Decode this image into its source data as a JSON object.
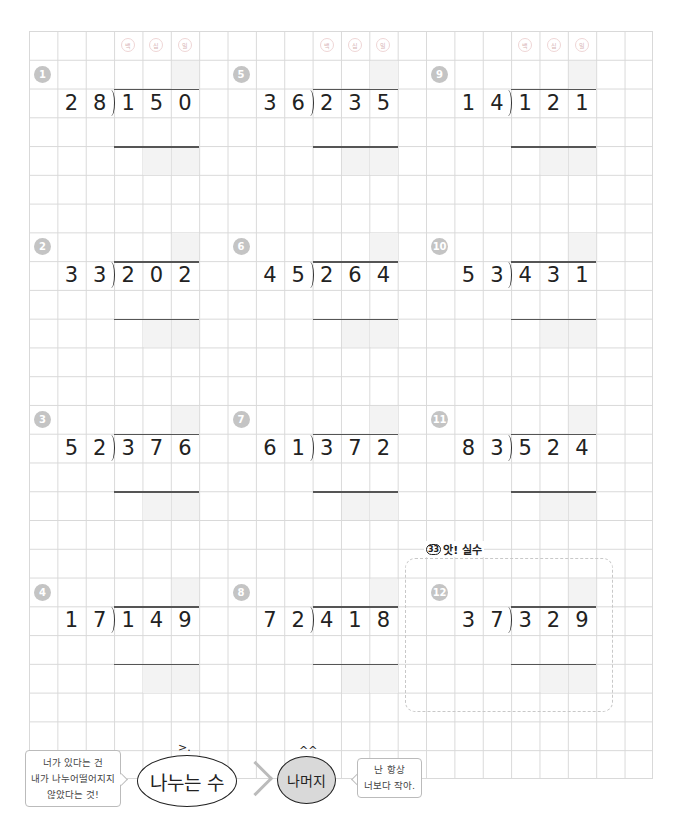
{
  "worksheet": {
    "column_headers": [
      "백",
      "십",
      "일"
    ],
    "mistake_section": {
      "icon": "33",
      "label": "앗! 실수"
    },
    "problems": [
      {
        "num": "1",
        "divisor": [
          "2",
          "8"
        ],
        "dividend": [
          "1",
          "5",
          "0"
        ]
      },
      {
        "num": "2",
        "divisor": [
          "3",
          "3"
        ],
        "dividend": [
          "2",
          "0",
          "2"
        ]
      },
      {
        "num": "3",
        "divisor": [
          "5",
          "2"
        ],
        "dividend": [
          "3",
          "7",
          "6"
        ]
      },
      {
        "num": "4",
        "divisor": [
          "1",
          "7"
        ],
        "dividend": [
          "1",
          "4",
          "9"
        ]
      },
      {
        "num": "5",
        "divisor": [
          "3",
          "6"
        ],
        "dividend": [
          "2",
          "3",
          "5"
        ]
      },
      {
        "num": "6",
        "divisor": [
          "4",
          "5"
        ],
        "dividend": [
          "2",
          "6",
          "4"
        ]
      },
      {
        "num": "7",
        "divisor": [
          "6",
          "1"
        ],
        "dividend": [
          "3",
          "7",
          "2"
        ]
      },
      {
        "num": "8",
        "divisor": [
          "7",
          "2"
        ],
        "dividend": [
          "4",
          "1",
          "8"
        ]
      },
      {
        "num": "9",
        "divisor": [
          "1",
          "4"
        ],
        "dividend": [
          "1",
          "2",
          "1"
        ]
      },
      {
        "num": "10",
        "divisor": [
          "5",
          "3"
        ],
        "dividend": [
          "4",
          "3",
          "1"
        ]
      },
      {
        "num": "11",
        "divisor": [
          "8",
          "3"
        ],
        "dividend": [
          "5",
          "2",
          "4"
        ]
      },
      {
        "num": "12",
        "divisor": [
          "3",
          "7"
        ],
        "dividend": [
          "3",
          "2",
          "9"
        ]
      }
    ]
  },
  "footer": {
    "left_bubble": [
      "너가 있다는 건",
      "내가 나누어떨어지지",
      "않았다는 것!"
    ],
    "divisor_character": "나누는 수",
    "divisor_face": ">.",
    "remainder_character": "나머지",
    "remainder_face": "^^",
    "right_bubble": [
      "난 항상",
      "너보다 작아."
    ]
  }
}
